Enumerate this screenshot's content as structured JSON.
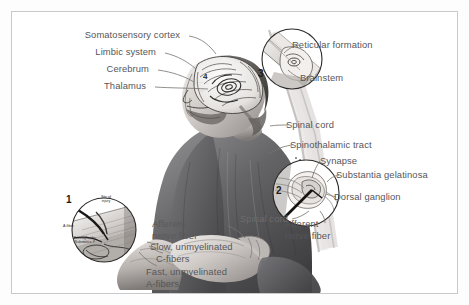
{
  "figure": {
    "frame_color": "#c9c9c9",
    "background_color": "#ffffff",
    "label_color": "#56565a",
    "ink_color": "#3a3a3a"
  },
  "labels": {
    "somatosensory_cortex": "Somatosensory cortex",
    "limbic_system": "Limbic system",
    "cerebrum": "Cerebrum",
    "thalamus": "Thalamus",
    "reticular_formation": "Reticular formation",
    "brainstem": "Brainstem",
    "spinal_cord_upper": "Spinal cord",
    "spinothalamic_tract": "Spinothalamic tract",
    "synapse": "Synapse",
    "substantia_gelatinosa": "Substantia gelatinosa",
    "dorsal_ganglion": "Dorsal ganglion",
    "spinal_cord_lower": "Spinal cord",
    "afferent_nerve_fiber_right_l1": "Afferent",
    "afferent_nerve_fiber_right_l2": "nerve fiber",
    "afferent_nerve_fiber_left_l1": "Afferent",
    "afferent_nerve_fiber_left_l2": "nerve fiber",
    "slow_unmyelinated": "Slow, unmyelinated",
    "c_fibers": "C-fibers",
    "fast_unmyelinated": "Fast, unmyelinated",
    "a_fibers": "A-fibers"
  },
  "inset_inner_labels": {
    "site_of_injury_l1": "Site of",
    "site_of_injury_l2": "injury",
    "a_fiber": "A-fiber",
    "prostaglandin_l1": "Prostaglandin,",
    "prostaglandin_l2": "Substance P"
  },
  "callouts": {
    "one": "1",
    "two": "2",
    "three": "3",
    "four": "4"
  }
}
